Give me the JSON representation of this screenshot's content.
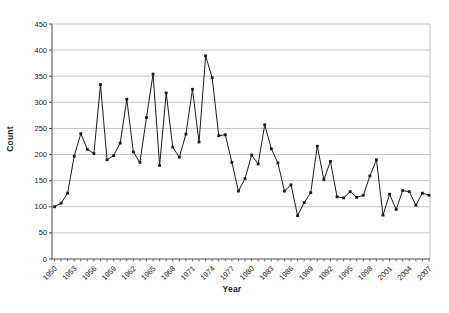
{
  "figure": {
    "background_color": "#ffffff",
    "plot_background_color": "#ffffff"
  },
  "chart_data": {
    "type": "line",
    "title": "",
    "xlabel": "Year",
    "ylabel": "Count",
    "x": [
      1950,
      1951,
      1952,
      1953,
      1954,
      1955,
      1956,
      1957,
      1958,
      1959,
      1960,
      1961,
      1962,
      1963,
      1964,
      1965,
      1966,
      1967,
      1968,
      1969,
      1970,
      1971,
      1972,
      1973,
      1974,
      1975,
      1976,
      1977,
      1978,
      1979,
      1980,
      1981,
      1982,
      1983,
      1984,
      1985,
      1986,
      1987,
      1988,
      1989,
      1990,
      1991,
      1992,
      1993,
      1994,
      1995,
      1996,
      1997,
      1998,
      1999,
      2000,
      2001,
      2002,
      2003,
      2004,
      2005,
      2006,
      2007
    ],
    "values": [
      100,
      107,
      126,
      197,
      240,
      210,
      202,
      334,
      190,
      198,
      222,
      306,
      205,
      185,
      271,
      354,
      179,
      318,
      214,
      195,
      239,
      325,
      224,
      389,
      347,
      236,
      238,
      185,
      130,
      154,
      199,
      182,
      257,
      211,
      184,
      130,
      142,
      83,
      108,
      127,
      216,
      152,
      187,
      119,
      117,
      129,
      118,
      122,
      159,
      190,
      84,
      124,
      95,
      131,
      129,
      103,
      126,
      122
    ],
    "ylim": [
      0,
      450
    ],
    "ytick_step": 50,
    "ytick_labels": [
      "0",
      "50",
      "100",
      "150",
      "200",
      "250",
      "300",
      "350",
      "400",
      "450"
    ],
    "xtick_labels": [
      "1950",
      "1953",
      "1956",
      "1959",
      "1962",
      "1965",
      "1968",
      "1971",
      "1974",
      "1977",
      "1980",
      "1983",
      "1986",
      "1989",
      "1992",
      "1995",
      "1998",
      "2001",
      "2004",
      "2007"
    ],
    "xtick_label_every": 3,
    "grid": true,
    "legend_position": "none",
    "marker": "square",
    "line_color": "#1a1a1a",
    "marker_color": "#1a1a1a",
    "grid_color": "#b9b9b9",
    "axis_color": "#4a4a4a",
    "tick_text_color": "#1a1a1a"
  }
}
